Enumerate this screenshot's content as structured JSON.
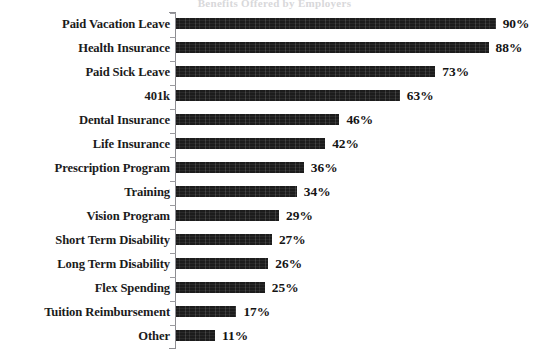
{
  "title_remnant": "Benefits Offered by Employers",
  "axis": {
    "spine_color": "#8d8d92",
    "bar_color": "#1c1c1c",
    "text_color": "#1b1b1b"
  },
  "chart_data": {
    "type": "bar",
    "orientation": "horizontal",
    "title": "",
    "xlabel": "",
    "ylabel": "",
    "xlim": [
      0,
      100
    ],
    "grid": false,
    "legend": null,
    "value_suffix": "%",
    "categories": [
      "Paid Vacation Leave",
      "Health Insurance",
      "Paid Sick Leave",
      "401k",
      "Dental Insurance",
      "Life Insurance",
      "Prescription Program",
      "Training",
      "Vision Program",
      "Short Term Disability",
      "Long Term Disability",
      "Flex Spending",
      "Tuition Reimbursement",
      "Other"
    ],
    "values": [
      90,
      88,
      73,
      63,
      46,
      42,
      36,
      34,
      29,
      27,
      26,
      25,
      17,
      11
    ],
    "labels": [
      "90%",
      "88%",
      "73%",
      "63%",
      "46%",
      "42%",
      "36%",
      "34%",
      "29%",
      "27%",
      "26%",
      "25%",
      "17%",
      "11%"
    ]
  }
}
